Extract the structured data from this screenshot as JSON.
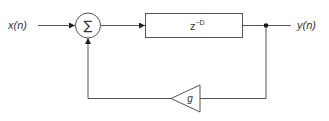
{
  "diagram": {
    "type": "block-diagram",
    "input": {
      "label": "x(n)"
    },
    "output": {
      "label": "y(n)"
    },
    "summer": {
      "symbol": "∑"
    },
    "delay": {
      "base": "z",
      "exponent": "−D"
    },
    "gain": {
      "label": "g"
    },
    "colors": {
      "stroke": "#555555",
      "text": "#333333",
      "background": "#ffffff"
    },
    "connections": [
      {
        "from": "x(n)",
        "to": "summer"
      },
      {
        "from": "summer",
        "to": "delay"
      },
      {
        "from": "delay",
        "to": "y(n)"
      },
      {
        "from": "y(n)",
        "to": "gain"
      },
      {
        "from": "gain",
        "to": "summer"
      }
    ]
  }
}
